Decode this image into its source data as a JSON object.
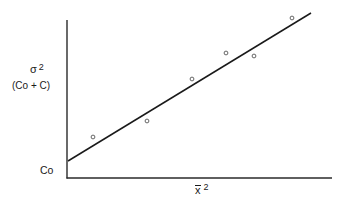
{
  "chart_data": {
    "type": "scatter",
    "title": "",
    "xlabel": "x̄²",
    "ylabel": "σ² (Co + C)",
    "ylabel_main": "σ",
    "ylabel_main_sup": "2",
    "ylabel_sub": "(Co + C)",
    "xlabel_base": "x",
    "xlabel_sup": "2",
    "y_intercept_label": "Co",
    "grid": false,
    "legend": null,
    "axis_ticks": "none (unscaled schematic)",
    "points_px": [
      {
        "x": 93,
        "y": 137
      },
      {
        "x": 147,
        "y": 121
      },
      {
        "x": 192,
        "y": 79
      },
      {
        "x": 226,
        "y": 53
      },
      {
        "x": 254,
        "y": 56
      },
      {
        "x": 292,
        "y": 18
      }
    ],
    "series": [
      {
        "name": "observed",
        "kind": "scatter",
        "x": [
          0.1,
          0.3,
          0.47,
          0.6,
          0.7,
          0.85
        ],
        "y": [
          0.26,
          0.36,
          0.63,
          0.79,
          0.77,
          1.01
        ]
      },
      {
        "name": "fitted line",
        "kind": "line",
        "x": [
          0.0,
          0.92
        ],
        "y": [
          0.11,
          1.05
        ]
      }
    ],
    "xlim": [
      0,
      1
    ],
    "ylim": [
      0,
      1.1
    ],
    "annotations": [
      "Co marks the y-intercept of the fitted line (nugget)"
    ]
  },
  "geometry": {
    "axis_origin": {
      "x": 67,
      "y": 178
    },
    "y_axis_top": 20,
    "x_axis_right": 332,
    "line_start": {
      "x": 68,
      "y": 161
    },
    "line_end": {
      "x": 311,
      "y": 13
    }
  }
}
